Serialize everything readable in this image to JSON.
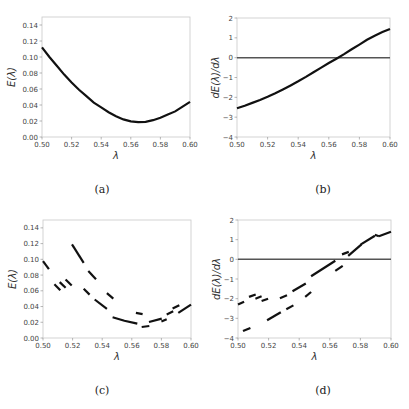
{
  "chart_data": [
    {
      "id": "a",
      "type": "line",
      "caption": "(a)",
      "xlabel": "λ",
      "ylabel": "E(λ)",
      "xlim": [
        0.5,
        0.6
      ],
      "ylim": [
        0.0,
        0.15
      ],
      "xticks": [
        0.5,
        0.52,
        0.54,
        0.56,
        0.58,
        0.6
      ],
      "xtick_labels": [
        "0.50",
        "0.52",
        "0.54",
        "0.56",
        "0.58",
        "0.60"
      ],
      "yticks": [
        0.0,
        0.02,
        0.04,
        0.06,
        0.08,
        0.1,
        0.12,
        0.14
      ],
      "ytick_labels": [
        "0.00",
        "0.02",
        "0.04",
        "0.06",
        "0.08",
        "0.10",
        "0.12",
        "0.14"
      ],
      "grid": false,
      "series": [
        {
          "name": "E",
          "x": [
            0.5,
            0.505,
            0.51,
            0.515,
            0.52,
            0.525,
            0.53,
            0.535,
            0.54,
            0.545,
            0.55,
            0.555,
            0.56,
            0.565,
            0.57,
            0.575,
            0.58,
            0.585,
            0.59,
            0.595,
            0.6
          ],
          "y": [
            0.112,
            0.1,
            0.089,
            0.078,
            0.068,
            0.059,
            0.051,
            0.043,
            0.037,
            0.031,
            0.026,
            0.022,
            0.0195,
            0.0185,
            0.019,
            0.021,
            0.024,
            0.028,
            0.032,
            0.038,
            0.044
          ]
        }
      ]
    },
    {
      "id": "b",
      "type": "line",
      "caption": "(b)",
      "xlabel": "λ",
      "ylabel": "dE(λ)/dλ",
      "xlim": [
        0.5,
        0.6
      ],
      "ylim": [
        -4,
        2
      ],
      "xticks": [
        0.5,
        0.52,
        0.54,
        0.56,
        0.58,
        0.6
      ],
      "xtick_labels": [
        "0.50",
        "0.52",
        "0.54",
        "0.56",
        "0.58",
        "0.60"
      ],
      "yticks": [
        -4,
        -3,
        -2,
        -1,
        0,
        1,
        2
      ],
      "ytick_labels": [
        "−4",
        "−3",
        "−2",
        "−1",
        "0",
        "1",
        "2"
      ],
      "grid": false,
      "reference_line": {
        "y": 0
      },
      "series": [
        {
          "name": "dE/dλ",
          "x": [
            0.5,
            0.505,
            0.51,
            0.515,
            0.52,
            0.525,
            0.53,
            0.535,
            0.54,
            0.545,
            0.55,
            0.555,
            0.56,
            0.565,
            0.57,
            0.575,
            0.58,
            0.585,
            0.59,
            0.595,
            0.6
          ],
          "y": [
            -2.55,
            -2.42,
            -2.28,
            -2.13,
            -1.97,
            -1.79,
            -1.6,
            -1.4,
            -1.19,
            -0.97,
            -0.74,
            -0.5,
            -0.27,
            -0.05,
            0.18,
            0.42,
            0.66,
            0.9,
            1.11,
            1.29,
            1.45
          ]
        }
      ]
    },
    {
      "id": "c",
      "type": "line",
      "caption": "(c)",
      "xlabel": "λ",
      "ylabel": "E(λ)",
      "xlim": [
        0.5,
        0.6
      ],
      "ylim": [
        0.0,
        0.15
      ],
      "xticks": [
        0.5,
        0.52,
        0.54,
        0.56,
        0.58,
        0.6
      ],
      "xtick_labels": [
        "0.50",
        "0.52",
        "0.54",
        "0.56",
        "0.58",
        "0.60"
      ],
      "yticks": [
        0.0,
        0.02,
        0.04,
        0.06,
        0.08,
        0.1,
        0.12,
        0.14
      ],
      "ytick_labels": [
        "0.00",
        "0.02",
        "0.04",
        "0.06",
        "0.08",
        "0.10",
        "0.12",
        "0.14"
      ],
      "grid": false,
      "segments": [
        [
          [
            0.5,
            0.0977
          ],
          [
            0.504,
            0.0875
          ]
        ],
        [
          [
            0.5077,
            0.0684
          ],
          [
            0.5117,
            0.0608
          ]
        ],
        [
          [
            0.5113,
            0.071
          ],
          [
            0.5153,
            0.064
          ]
        ],
        [
          [
            0.5153,
            0.0744
          ],
          [
            0.5194,
            0.0667
          ]
        ],
        [
          [
            0.5196,
            0.119
          ],
          [
            0.5275,
            0.0956
          ]
        ],
        [
          [
            0.5306,
            0.085
          ],
          [
            0.5358,
            0.0748
          ]
        ],
        [
          [
            0.5275,
            0.0625
          ],
          [
            0.5315,
            0.0552
          ]
        ],
        [
          [
            0.5349,
            0.0489
          ],
          [
            0.5432,
            0.037
          ]
        ],
        [
          [
            0.5432,
            0.0569
          ],
          [
            0.5475,
            0.05
          ]
        ],
        [
          [
            0.547,
            0.0263
          ],
          [
            0.555,
            0.022
          ],
          [
            0.5637,
            0.0183
          ]
        ],
        [
          [
            0.5628,
            0.0319
          ],
          [
            0.5673,
            0.0302
          ]
        ],
        [
          [
            0.5667,
            0.014
          ],
          [
            0.5718,
            0.0153
          ]
        ],
        [
          [
            0.5716,
            0.0204
          ],
          [
            0.5802,
            0.0246
          ]
        ],
        [
          [
            0.58,
            0.0208
          ],
          [
            0.5836,
            0.0238
          ]
        ],
        [
          [
            0.5836,
            0.03
          ],
          [
            0.588,
            0.034
          ]
        ],
        [
          [
            0.5876,
            0.0374
          ],
          [
            0.5921,
            0.0416
          ]
        ],
        [
          [
            0.5914,
            0.0319
          ],
          [
            0.6,
            0.0425
          ]
        ]
      ]
    },
    {
      "id": "d",
      "type": "line",
      "caption": "(d)",
      "xlabel": "λ",
      "ylabel": "dE(λ)/dλ",
      "xlim": [
        0.5,
        0.6
      ],
      "ylim": [
        -4,
        2
      ],
      "xticks": [
        0.5,
        0.52,
        0.54,
        0.56,
        0.58,
        0.6
      ],
      "xtick_labels": [
        "0.50",
        "0.52",
        "0.54",
        "0.56",
        "0.58",
        "0.60"
      ],
      "yticks": [
        -4,
        -3,
        -2,
        -1,
        0,
        1,
        2
      ],
      "ytick_labels": [
        "−4",
        "−3",
        "−2",
        "−1",
        "0",
        "1",
        "2"
      ],
      "grid": false,
      "reference_line": {
        "y": 0
      },
      "segments": [
        [
          [
            0.5,
            -2.3
          ],
          [
            0.504,
            -2.16
          ]
        ],
        [
          [
            0.5033,
            -3.65
          ],
          [
            0.5081,
            -3.49
          ]
        ],
        [
          [
            0.5072,
            -1.91
          ],
          [
            0.5116,
            -1.79
          ]
        ],
        [
          [
            0.5114,
            -2.0
          ],
          [
            0.5154,
            -1.88
          ]
        ],
        [
          [
            0.5154,
            -2.12
          ],
          [
            0.5197,
            -2.0
          ]
        ],
        [
          [
            0.519,
            -3.1
          ],
          [
            0.528,
            -2.69
          ]
        ],
        [
          [
            0.5274,
            -1.98
          ],
          [
            0.532,
            -1.83
          ]
        ],
        [
          [
            0.5316,
            -2.54
          ],
          [
            0.5362,
            -2.34
          ]
        ],
        [
          [
            0.5356,
            -1.62
          ],
          [
            0.5443,
            -1.23
          ]
        ],
        [
          [
            0.5439,
            -1.91
          ],
          [
            0.5478,
            -1.66
          ]
        ],
        [
          [
            0.5478,
            -0.86
          ],
          [
            0.5636,
            -0.07
          ]
        ],
        [
          [
            0.5636,
            -0.59
          ],
          [
            0.5684,
            -0.33
          ]
        ],
        [
          [
            0.568,
            0.25
          ],
          [
            0.5724,
            0.38
          ]
        ],
        [
          [
            0.572,
            0.18
          ],
          [
            0.5807,
            0.76
          ]
        ],
        [
          [
            0.5803,
            0.76
          ],
          [
            0.5895,
            1.2
          ]
        ],
        [
          [
            0.5895,
            1.25
          ],
          [
            0.5921,
            1.17
          ]
        ],
        [
          [
            0.5921,
            1.17
          ],
          [
            0.6,
            1.4
          ]
        ]
      ]
    }
  ]
}
